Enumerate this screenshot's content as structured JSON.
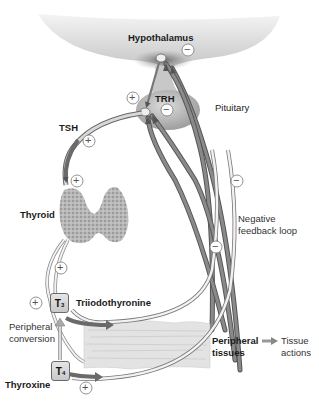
{
  "diagram": {
    "nodes": {
      "hypothalamus": "Hypothalamus",
      "trh": "TRH",
      "pituitary": "Pituitary",
      "tsh": "TSH",
      "thyroid": "Thyroid",
      "t3_symbol": "T",
      "t3_sub": "3",
      "t3_name": "Triiodothyronine",
      "t4_symbol": "T",
      "t4_sub": "4",
      "t4_name": "Thyroxine",
      "peripheral_conversion_line1": "Peripheral",
      "peripheral_conversion_line2": "conversion",
      "peripheral_tissues_line1": "Peripheral",
      "peripheral_tissues_line2": "tissues",
      "tissue_actions_line1": "Tissue",
      "tissue_actions_line2": "actions",
      "negative_feedback_line1": "Negative",
      "negative_feedback_line2": "feedback loop"
    },
    "signs": {
      "plus": "+",
      "minus": "−"
    },
    "edges": [
      {
        "from": "Hypothalamus",
        "to": "Pituitary",
        "label": "TRH",
        "sign": "+"
      },
      {
        "from": "Pituitary",
        "to": "Thyroid",
        "label": "TSH",
        "sign": "+"
      },
      {
        "from": "Thyroid",
        "to": "T3",
        "label": "Triiodothyronine",
        "sign": "+"
      },
      {
        "from": "Thyroid",
        "to": "T4",
        "label": "Thyroxine",
        "sign": "+"
      },
      {
        "from": "T4",
        "to": "T3",
        "label": "Peripheral conversion",
        "sign": "+"
      },
      {
        "from": "T3",
        "to": "Peripheral tissues",
        "sign": "+"
      },
      {
        "from": "T4",
        "to": "Peripheral tissues",
        "sign": "+"
      },
      {
        "from": "Peripheral tissues",
        "to": "Tissue actions"
      },
      {
        "from": "T3/T4",
        "to": "Hypothalamus",
        "label": "Negative feedback loop",
        "sign": "−"
      },
      {
        "from": "T3/T4",
        "to": "Pituitary",
        "label": "Negative feedback loop",
        "sign": "−"
      }
    ],
    "colors": {
      "arrow_dark": "#6b6b6b",
      "arrow_light": "#d9d9d9",
      "tissue_fill": "#e2e2e2",
      "brain_fill": "#cfcfcf",
      "thyroid_fill": "#b5b5b5"
    }
  }
}
